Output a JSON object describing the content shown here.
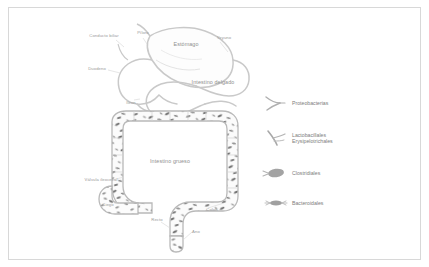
{
  "figure": {
    "border_color": "#d8d8d8",
    "background": "#ffffff",
    "organ_outline_color": "#c9c9c9",
    "label_color": "#9a9a9a",
    "bacteria_color": "#6f6f6f"
  },
  "anatomy_labels": [
    {
      "id": "conducto-biliar",
      "text": "Conducto\nbiliar",
      "x": 104,
      "y": 36,
      "size": "small"
    },
    {
      "id": "piloro",
      "text": "Píloro",
      "x": 143,
      "y": 33,
      "size": "small"
    },
    {
      "id": "estomago",
      "text": "Estómago",
      "x": 186,
      "y": 44,
      "size": "big"
    },
    {
      "id": "yeyuno",
      "text": "Yeyuno",
      "x": 224,
      "y": 38,
      "size": "small"
    },
    {
      "id": "duodeno",
      "text": "Duodeno",
      "x": 97,
      "y": 69,
      "size": "small"
    },
    {
      "id": "intestino-delgado",
      "text": "Intestino\ndelgado",
      "x": 213,
      "y": 82,
      "size": "big"
    },
    {
      "id": "ileon",
      "text": "Íleon",
      "x": 131,
      "y": 103,
      "size": "small"
    },
    {
      "id": "intestino-grueso",
      "text": "Intestino\ngrueso",
      "x": 170,
      "y": 161,
      "size": "big"
    },
    {
      "id": "valvula-ileocecal",
      "text": "Válvula\nileocecal",
      "x": 101,
      "y": 180,
      "size": "small"
    },
    {
      "id": "ciego",
      "text": "Ciego",
      "x": 108,
      "y": 205,
      "size": "small"
    },
    {
      "id": "colon",
      "text": "Colon",
      "x": 212,
      "y": 210,
      "size": "small"
    },
    {
      "id": "recto",
      "text": "Recto",
      "x": 157,
      "y": 220,
      "size": "small"
    },
    {
      "id": "ano",
      "text": "Ano",
      "x": 196,
      "y": 232,
      "size": "small"
    }
  ],
  "legend": {
    "items": [
      {
        "id": "proteobacterias",
        "label": "Proteobacterias",
        "icon": "flagellated-rod-icon",
        "y": 10
      },
      {
        "id": "lactobacillales-erysipelotrichales",
        "label": "Lactobacillales\nErysipelotrichales",
        "icon": "curved-flagellated-rod-icon",
        "y": 45
      },
      {
        "id": "clostridiales",
        "label": "Clostridiales",
        "icon": "filled-oval-icon",
        "y": 80
      },
      {
        "id": "bacteroidales",
        "label": "Bacteroidales",
        "icon": "fimbriated-rod-icon",
        "y": 110
      }
    ]
  }
}
